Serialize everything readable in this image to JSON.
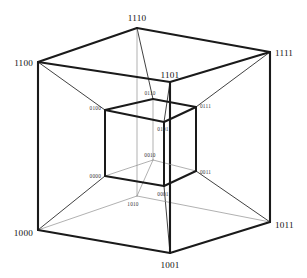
{
  "figure": {
    "background_color": "#ffffff",
    "line_color": "#1a1a1a",
    "hidden_line_color": "#8f8f8f"
  },
  "outer_cube": {
    "name": "outer-cube",
    "vertices": [
      {
        "id": "1110",
        "label": "1110",
        "x": 137,
        "y": 28,
        "lx": 137,
        "ly": 21,
        "anchor": "middle",
        "size": "outer"
      },
      {
        "id": "1100",
        "label": "1100",
        "x": 38,
        "y": 62,
        "lx": 33,
        "ly": 64,
        "anchor": "end",
        "size": "outer"
      },
      {
        "id": "1111",
        "label": "1111",
        "x": 270,
        "y": 52,
        "lx": 275,
        "ly": 54,
        "anchor": "start",
        "size": "outer"
      },
      {
        "id": "1101",
        "label": "1101",
        "x": 170,
        "y": 82,
        "lx": 170,
        "ly": 78,
        "anchor": "middle",
        "size": "outer"
      },
      {
        "id": "1000",
        "label": "1000",
        "x": 38,
        "y": 230,
        "lx": 33,
        "ly": 234,
        "anchor": "end",
        "size": "outer"
      },
      {
        "id": "1011",
        "label": "1011",
        "x": 270,
        "y": 222,
        "lx": 275,
        "ly": 226,
        "anchor": "start",
        "size": "outer"
      },
      {
        "id": "1001",
        "label": "1001",
        "x": 170,
        "y": 253,
        "lx": 170,
        "ly": 266,
        "anchor": "middle",
        "size": "outer"
      },
      {
        "id": "1010",
        "label": "1010",
        "x": 137,
        "y": 196,
        "lx": 133,
        "ly": 204,
        "anchor": "middle",
        "size": "inner"
      }
    ]
  },
  "inner_cube": {
    "name": "inner-cube",
    "vertices": [
      {
        "id": "0110",
        "label": "0110",
        "x": 153,
        "y": 99,
        "lx": 149,
        "ly": 93,
        "anchor": "middle",
        "size": "inner"
      },
      {
        "id": "0100",
        "label": "0100",
        "x": 105,
        "y": 110,
        "lx": 101,
        "ly": 108,
        "anchor": "end",
        "size": "inner"
      },
      {
        "id": "0111",
        "label": "0111",
        "x": 196,
        "y": 107,
        "lx": 200,
        "ly": 106,
        "anchor": "start",
        "size": "inner"
      },
      {
        "id": "0101",
        "label": "0101",
        "x": 164,
        "y": 122,
        "lx": 164,
        "ly": 130,
        "anchor": "middle",
        "size": "inner"
      },
      {
        "id": "0000",
        "label": "0000",
        "x": 105,
        "y": 176,
        "lx": 101,
        "ly": 176,
        "anchor": "end",
        "size": "inner"
      },
      {
        "id": "0011",
        "label": "0011",
        "x": 196,
        "y": 171,
        "lx": 200,
        "ly": 172,
        "anchor": "start",
        "size": "inner"
      },
      {
        "id": "0001",
        "label": "0001",
        "x": 164,
        "y": 186,
        "lx": 160,
        "ly": 193,
        "anchor": "middle",
        "size": "inner"
      },
      {
        "id": "0010",
        "label": "0010",
        "x": 153,
        "y": 160,
        "lx": 149,
        "ly": 155,
        "anchor": "middle",
        "size": "inner"
      }
    ]
  },
  "labels": {
    "outer": [
      "1110",
      "1100",
      "1111",
      "1101",
      "1000",
      "1011",
      "1001",
      "1010"
    ],
    "inner": [
      "0110",
      "0100",
      "0111",
      "0101",
      "0000",
      "0011",
      "0001",
      "0010"
    ]
  },
  "edge_counts": {
    "outer_cube_edges": 12,
    "inner_cube_edges": 12,
    "connecting_edges": 8,
    "total_vertices": 16
  }
}
